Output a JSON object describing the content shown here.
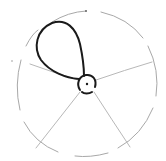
{
  "diagram": {
    "type": "hand-drawn sketch",
    "colors": {
      "background": "#ffffff",
      "outer_circle": "#a8a8a8",
      "spokes": "#b8b8b8",
      "loop": "#1a1a1a",
      "hub": "#1a1a1a"
    },
    "outer_circle": {
      "cx": 88,
      "cy": 84,
      "r": 70
    },
    "hub": {
      "cx": 87,
      "cy": 84,
      "r": 9
    },
    "spokes": [
      {
        "angle_label": "left",
        "x2": 28,
        "y2": 65
      },
      {
        "angle_label": "right",
        "x2": 152,
        "y2": 62
      },
      {
        "angle_label": "lower-left",
        "x2": 36,
        "y2": 148
      },
      {
        "angle_label": "lower-right",
        "x2": 130,
        "y2": 147
      }
    ],
    "loop": {
      "path": "M82,78 C70,78 50,72 40,58 C32,45 38,28 52,22 C66,17 78,30 82,48 C85,60 84,70 84,76"
    }
  }
}
